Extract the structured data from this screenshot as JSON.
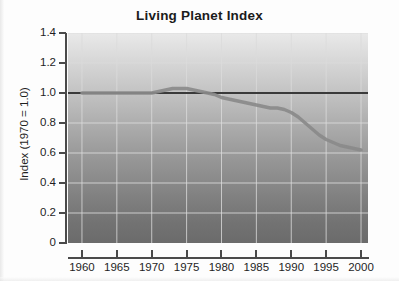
{
  "chart_data": {
    "type": "line",
    "title": "Living Planet Index",
    "xlabel": "",
    "ylabel": "Index (1970 = 1.0)",
    "xlim": [
      1958,
      2001
    ],
    "ylim": [
      0,
      1.4
    ],
    "grid": true,
    "legend": false,
    "background": "vertical gray gradient, light at top to dark at bottom",
    "x_ticks": [
      1960,
      1965,
      1970,
      1975,
      1980,
      1985,
      1990,
      1995,
      2000
    ],
    "x_tick_labels": [
      "1960",
      "1965",
      "1970",
      "1975",
      "1980",
      "1985",
      "1990",
      "1995",
      "2000"
    ],
    "y_ticks": [
      0,
      0.2,
      0.4,
      0.6,
      0.8,
      1.0,
      1.2,
      1.4
    ],
    "y_tick_labels": [
      "0",
      "0.2",
      "0.4",
      "0.6",
      "0.8",
      "1.0",
      "1.2",
      "1.4"
    ],
    "series": [
      {
        "name": "Reference line (index = 1.0)",
        "style": "solid dark horizontal line",
        "color": "#3a3a3a",
        "x": [
          1958,
          2001
        ],
        "values": [
          1.0,
          1.0
        ]
      },
      {
        "name": "Living Planet Index",
        "style": "thick gray line",
        "color": "#8a8a8a",
        "x": [
          1960,
          1962,
          1964,
          1966,
          1968,
          1970,
          1971,
          1972,
          1973,
          1974,
          1975,
          1976,
          1977,
          1978,
          1979,
          1980,
          1981,
          1982,
          1983,
          1984,
          1985,
          1986,
          1987,
          1988,
          1989,
          1990,
          1991,
          1992,
          1993,
          1994,
          1995,
          1996,
          1997,
          1998,
          1999,
          2000
        ],
        "values": [
          1.0,
          1.0,
          1.0,
          1.0,
          1.0,
          1.0,
          1.01,
          1.02,
          1.03,
          1.03,
          1.03,
          1.02,
          1.01,
          1.0,
          0.99,
          0.97,
          0.96,
          0.95,
          0.94,
          0.93,
          0.92,
          0.91,
          0.9,
          0.9,
          0.89,
          0.87,
          0.84,
          0.8,
          0.76,
          0.72,
          0.69,
          0.67,
          0.65,
          0.64,
          0.63,
          0.62
        ]
      }
    ],
    "annotations": []
  },
  "colors": {
    "axis": "#4a4a4a",
    "text": "#1f1f1f",
    "title": "#1b1b1b",
    "gridline": "#dcdcdc",
    "reference_line": "#3a3a3a",
    "data_line": "#8a8a8a",
    "plot_top": "#e9e9e9",
    "plot_bottom": "#6b6b6b"
  }
}
